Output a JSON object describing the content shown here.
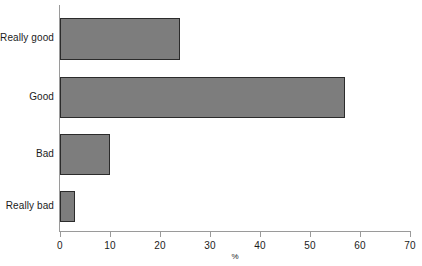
{
  "chart_data": {
    "type": "bar",
    "orientation": "horizontal",
    "title": "",
    "subtitle": "",
    "xlabel": "%",
    "ylabel": "",
    "categories": [
      "Really good",
      "Good",
      "Bad",
      "Really bad"
    ],
    "values": [
      24,
      57,
      10,
      3
    ],
    "series": [
      {
        "name": "",
        "values": [
          24,
          57,
          10,
          3
        ]
      }
    ],
    "xlim": [
      0,
      70
    ],
    "xticks": [
      0,
      10,
      20,
      30,
      40,
      50,
      60,
      70
    ],
    "xtick_labels": [
      "0",
      "10",
      "20",
      "30",
      "40",
      "50",
      "60",
      "70"
    ],
    "grid": false,
    "legend": false,
    "legend_position": "none",
    "bar_fill_color": "#7d7d7d",
    "bar_edge_color": "#2b2b2b",
    "axis_color": "#9a9a9a",
    "background_color": "#ffffff",
    "text_color": "#1b1b1b"
  }
}
